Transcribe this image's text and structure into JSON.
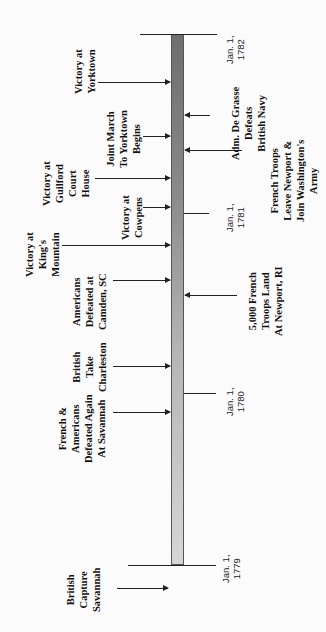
{
  "timeline": {
    "orientation": "vertical, rotated -90deg (time runs bottom to top)",
    "ticks": [
      {
        "label": "Jan. 1,\n1782",
        "year": 1782
      },
      {
        "label": "Jan. 1,\n1781",
        "year": 1781
      },
      {
        "label": "Jan. 1,\n1780",
        "year": 1780
      },
      {
        "label": "Jan. 1,\n1779",
        "year": 1779
      }
    ],
    "left_events": [
      {
        "label": "Victory at\nYorktown"
      },
      {
        "label": "Joint March\nTo Yorktown\nBegins"
      },
      {
        "label": "Victory at\nGuilford\nCourt\nHouse"
      },
      {
        "label": "Victory at\nCowpens"
      },
      {
        "label": "Victory at\nKing's\nMountain"
      },
      {
        "label": "Americans\nDefeated at\nCamden, SC"
      },
      {
        "label": "British\nTake\nCharleston"
      },
      {
        "label": "French &\nAmericans\nDefeated Again\nAt Savannah"
      },
      {
        "label": "British\nCapture\nSavannah"
      }
    ],
    "right_events": [
      {
        "label": "Adm. De Grasse\nDefeats\nBritish Navy"
      },
      {
        "label": "French Troops\nLeave Newport &\nJoin Washington's\nArmy"
      },
      {
        "label": "5,000 French\nTroops Land\nAt Newport, RI"
      }
    ],
    "colors": {
      "bar_dark": "#6e6e6e",
      "bar_light": "#d6d6d6",
      "line": "#222222"
    }
  }
}
